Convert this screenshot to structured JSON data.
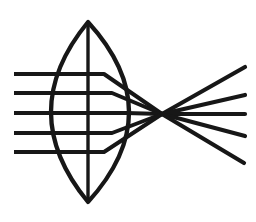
{
  "figure": {
    "background_color": "#ffffff",
    "ink_color": "#171717",
    "canvas": {
      "width": 256,
      "height": 222
    }
  },
  "lens": {
    "label": "biconvex-lens",
    "apex_top": {
      "x": 88,
      "y": 22
    },
    "apex_bottom": {
      "x": 88,
      "y": 202
    },
    "bulge_left_x": 51,
    "bulge_right_x": 129,
    "center": {
      "x": 88,
      "y": 112
    },
    "stroke_width": 4.2
  },
  "optical_axis": {
    "label": "principal-axis",
    "x": 88,
    "y_top": 22,
    "y_bottom": 202,
    "stroke_width": 3.4
  },
  "focal_point": {
    "x": 162,
    "y": 114,
    "label": "focal-point"
  },
  "incoming_rays": [
    {
      "id": "ray-1",
      "x_start": 14,
      "y": 74,
      "x_end": 104
    },
    {
      "id": "ray-2",
      "x_start": 14,
      "y": 93,
      "x_end": 112
    },
    {
      "id": "ray-3",
      "x_start": 14,
      "y": 113,
      "x_end": 126
    },
    {
      "id": "ray-4",
      "x_start": 14,
      "y": 133,
      "x_end": 112
    },
    {
      "id": "ray-5",
      "x_start": 14,
      "y": 152,
      "x_end": 104
    }
  ],
  "refracted_rays": [
    {
      "id": "refracted-1",
      "x_start": 104,
      "y_start": 74,
      "x_end": 162,
      "y_end": 114
    },
    {
      "id": "refracted-2",
      "x_start": 112,
      "y_start": 93,
      "x_end": 162,
      "y_end": 114
    },
    {
      "id": "refracted-3",
      "x_start": 126,
      "y_start": 113,
      "x_end": 162,
      "y_end": 114
    },
    {
      "id": "refracted-4",
      "x_start": 112,
      "y_start": 133,
      "x_end": 162,
      "y_end": 114
    },
    {
      "id": "refracted-5",
      "x_start": 104,
      "y_start": 152,
      "x_end": 162,
      "y_end": 114
    }
  ],
  "diverging_rays": [
    {
      "id": "diverging-1",
      "x_start": 162,
      "y_start": 114,
      "x_end": 245,
      "y_end": 67
    },
    {
      "id": "diverging-2",
      "x_start": 162,
      "y_start": 114,
      "x_end": 245,
      "y_end": 95
    },
    {
      "id": "diverging-3",
      "x_start": 162,
      "y_start": 114,
      "x_end": 245,
      "y_end": 114
    },
    {
      "id": "diverging-4",
      "x_start": 162,
      "y_start": 114,
      "x_end": 245,
      "y_end": 136
    },
    {
      "id": "diverging-5",
      "x_start": 162,
      "y_start": 114,
      "x_end": 244,
      "y_end": 163
    }
  ]
}
